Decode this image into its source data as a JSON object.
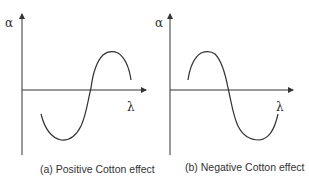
{
  "panels": [
    {
      "id": "a",
      "caption": "(a) Positive Cotton effect",
      "y_axis_label": "α",
      "x_axis_label": "λ",
      "curve": "positive"
    },
    {
      "id": "b",
      "caption": "(b) Negative Cotton effect",
      "y_axis_label": "α",
      "x_axis_label": "λ",
      "curve": "negative"
    }
  ],
  "colors": {
    "line": "#333333",
    "background": "#ffffff"
  }
}
